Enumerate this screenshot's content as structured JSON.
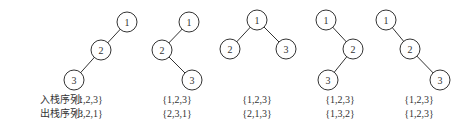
{
  "labels": {
    "push_label": "入栈序列",
    "pop_label": "出栈序列",
    "separator": ":"
  },
  "trees": [
    {
      "id": "tree-1",
      "nodes": [
        "1",
        "2",
        "3"
      ],
      "edges": [
        [
          "1",
          "2"
        ],
        [
          "2",
          "3"
        ]
      ],
      "shape": "1 root; 2 left child of 1; 3 left child of 2",
      "push_sequence": "{1,2,3}",
      "pop_sequence": "{3,2,1}"
    },
    {
      "id": "tree-2",
      "nodes": [
        "1",
        "2",
        "3"
      ],
      "edges": [
        [
          "1",
          "2"
        ],
        [
          "2",
          "3"
        ]
      ],
      "shape": "1 root; 2 left child of 1; 3 right child of 2",
      "push_sequence": "{1,2,3}",
      "pop_sequence": "{2,3,1}"
    },
    {
      "id": "tree-3",
      "nodes": [
        "1",
        "2",
        "3"
      ],
      "edges": [
        [
          "1",
          "2"
        ],
        [
          "1",
          "3"
        ]
      ],
      "shape": "1 root; 2 left child of 1; 3 right child of 1",
      "push_sequence": "{1,2,3}",
      "pop_sequence": "{2,1,3}"
    },
    {
      "id": "tree-4",
      "nodes": [
        "1",
        "2",
        "3"
      ],
      "edges": [
        [
          "1",
          "2"
        ],
        [
          "2",
          "3"
        ]
      ],
      "shape": "1 root; 2 right child of 1; 3 left child of 2",
      "push_sequence": "{1,2,3}",
      "pop_sequence": "{1,3,2}"
    },
    {
      "id": "tree-5",
      "nodes": [
        "1",
        "2",
        "3"
      ],
      "edges": [
        [
          "1",
          "2"
        ],
        [
          "2",
          "3"
        ]
      ],
      "shape": "1 root; 2 right child of 1; 3 right child of 2",
      "push_sequence": "{1,2,3}",
      "pop_sequence": "{1,2,3}"
    }
  ]
}
